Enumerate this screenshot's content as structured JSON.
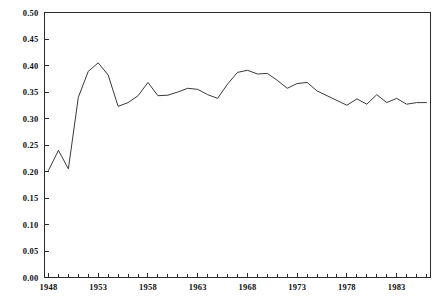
{
  "chart_data": {
    "type": "line",
    "title": "",
    "subtitle": "",
    "xlabel": "",
    "ylabel": "",
    "xlim": [
      1947.6,
      1986.4
    ],
    "ylim": [
      0.0,
      0.5
    ],
    "grid": false,
    "legend": null,
    "legend_position": "none",
    "line_color": "#3a3a3a",
    "y_tick_labels": [
      "0.50",
      "0.45",
      "0.40",
      "0.35",
      "0.30",
      "0.25",
      "0.20",
      "0.15",
      "0.10",
      "0.05",
      "0.00"
    ],
    "y_tick_values": [
      0.5,
      0.45,
      0.4,
      0.35,
      0.3,
      0.25,
      0.2,
      0.15,
      0.1,
      0.05,
      0.0
    ],
    "x_tick_labels": [
      "1948",
      "1953",
      "1958",
      "1963",
      "1968",
      "1973",
      "1978",
      "1983"
    ],
    "x_tick_values": [
      1948,
      1953,
      1958,
      1963,
      1968,
      1973,
      1978,
      1983
    ],
    "x_minor_step": 1,
    "x": [
      1948,
      1949,
      1950,
      1951,
      1952,
      1953,
      1954,
      1955,
      1956,
      1957,
      1958,
      1959,
      1960,
      1961,
      1962,
      1963,
      1964,
      1965,
      1966,
      1967,
      1968,
      1969,
      1970,
      1971,
      1972,
      1973,
      1974,
      1975,
      1976,
      1977,
      1978,
      1979,
      1980,
      1981,
      1982,
      1983,
      1984,
      1985,
      1986
    ],
    "values": [
      0.202,
      0.24,
      0.205,
      0.34,
      0.389,
      0.405,
      0.382,
      0.323,
      0.33,
      0.343,
      0.368,
      0.343,
      0.344,
      0.35,
      0.357,
      0.355,
      0.345,
      0.338,
      0.365,
      0.387,
      0.391,
      0.384,
      0.385,
      0.372,
      0.357,
      0.366,
      0.368,
      0.352,
      0.343,
      0.334,
      0.325,
      0.337,
      0.327,
      0.345,
      0.33,
      0.338,
      0.327,
      0.33,
      0.33
    ],
    "series": [
      {
        "name": "series-1",
        "values": [
          0.202,
          0.24,
          0.205,
          0.34,
          0.389,
          0.405,
          0.382,
          0.323,
          0.33,
          0.343,
          0.368,
          0.343,
          0.344,
          0.35,
          0.357,
          0.355,
          0.345,
          0.338,
          0.365,
          0.387,
          0.391,
          0.384,
          0.385,
          0.372,
          0.357,
          0.366,
          0.368,
          0.352,
          0.343,
          0.334,
          0.325,
          0.337,
          0.327,
          0.345,
          0.33,
          0.338,
          0.327,
          0.33,
          0.33
        ]
      }
    ]
  }
}
